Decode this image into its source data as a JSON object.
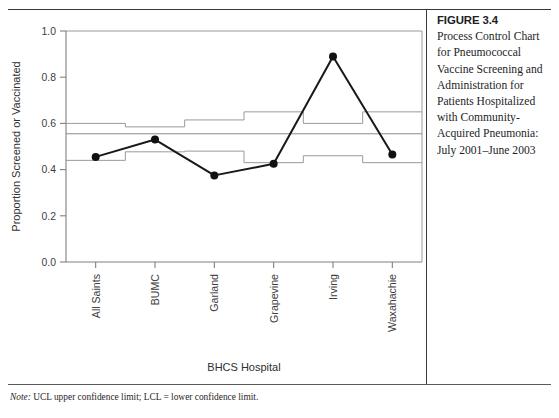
{
  "figure": {
    "number_label": "FIGURE 3.4",
    "caption": "Process Control Chart for Pneumococcal Vaccine Screening and Administration for Patients Hospitalized with Community-Acquired Pneumonia: July 2001–June 2003",
    "note_label": "Note:",
    "note_text": " UCL upper confidence limit; LCL = lower confidence limit."
  },
  "chart_data": {
    "type": "line",
    "title": "",
    "xlabel": "BHCS Hospital",
    "ylabel": "Proportion Screened or Vaccinated",
    "categories": [
      "All Saints",
      "BUMC",
      "Garland",
      "Grapevine",
      "Irving",
      "Waxahachie"
    ],
    "ylim": [
      0.0,
      1.0
    ],
    "ytick_labels": [
      "0.0",
      "0.2",
      "0.4",
      "0.6",
      "0.8",
      "1.0"
    ],
    "ytick_values": [
      0.0,
      0.2,
      0.4,
      0.6,
      0.8,
      1.0
    ],
    "grid": false,
    "legend": "none",
    "series": [
      {
        "name": "Proportion screened or vaccinated",
        "values": [
          0.455,
          0.53,
          0.375,
          0.425,
          0.89,
          0.465
        ],
        "marker": "filled-circle",
        "color": "#181818"
      }
    ],
    "center_line": {
      "name": "Mean",
      "value": 0.555,
      "color": "#8c8c8c"
    },
    "upper_control_limit": {
      "name": "UCL",
      "values": [
        0.6,
        0.585,
        0.615,
        0.65,
        0.6,
        0.65
      ],
      "style": "step",
      "color": "#9a9a9a"
    },
    "lower_control_limit": {
      "name": "LCL",
      "values": [
        0.44,
        0.477,
        0.48,
        0.43,
        0.46,
        0.43
      ],
      "style": "step",
      "color": "#9a9a9a"
    }
  }
}
